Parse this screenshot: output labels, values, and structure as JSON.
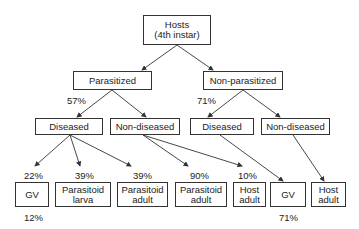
{
  "diagram": {
    "type": "tree",
    "nodes": {
      "root": {
        "label": "Hosts\n(4th instar)"
      },
      "parasitized": {
        "label": "Parasitized"
      },
      "non_parasitized": {
        "label": "Non-parasitized"
      },
      "p_diseased": {
        "label": "Diseased"
      },
      "p_non_diseased": {
        "label": "Non-diseased"
      },
      "np_diseased": {
        "label": "Diseased"
      },
      "np_non_diseased": {
        "label": "Non-diseased"
      },
      "gv_1": {
        "label": "GV"
      },
      "parasitoid_larva": {
        "label": "Parasitoid\nlarva"
      },
      "parasitoid_adult_1": {
        "label": "Parasitoid\nadult"
      },
      "parasitoid_adult_2": {
        "label": "Parasitoid\nadult"
      },
      "host_adult_1": {
        "label": "Host\nadult"
      },
      "gv_2": {
        "label": "GV"
      },
      "host_adult_2": {
        "label": "Host\nadult"
      }
    },
    "percentages": {
      "parasitized_diseased": "57%",
      "non_parasitized_diseased": "71%",
      "gv_1_in": "22%",
      "parasitoid_larva_in": "39%",
      "parasitoid_adult_1_in": "39%",
      "parasitoid_adult_2_in": "90%",
      "host_adult_1_in": "10%",
      "gv_1_below": "12%",
      "gv_2_below": "71%"
    },
    "edges": [
      [
        "root",
        "parasitized"
      ],
      [
        "root",
        "non_parasitized"
      ],
      [
        "parasitized",
        "p_diseased"
      ],
      [
        "parasitized",
        "p_non_diseased"
      ],
      [
        "non_parasitized",
        "np_diseased"
      ],
      [
        "non_parasitized",
        "np_non_diseased"
      ],
      [
        "p_diseased",
        "gv_1"
      ],
      [
        "p_diseased",
        "parasitoid_larva"
      ],
      [
        "p_diseased",
        "parasitoid_adult_1"
      ],
      [
        "p_non_diseased",
        "parasitoid_adult_2"
      ],
      [
        "p_non_diseased",
        "host_adult_1"
      ],
      [
        "np_diseased",
        "gv_2"
      ],
      [
        "np_non_diseased",
        "host_adult_2"
      ]
    ],
    "colors": {
      "line": "#333333",
      "text": "#222222",
      "background": "#ffffff"
    }
  }
}
